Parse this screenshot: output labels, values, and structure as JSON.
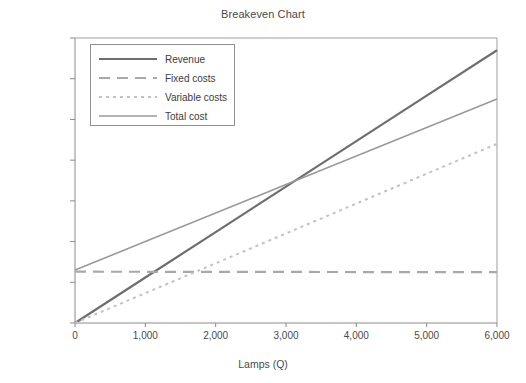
{
  "chart_data": {
    "type": "line",
    "title": "Breakeven Chart",
    "xlabel": "Lamps (Q)",
    "ylabel": "",
    "xlim": [
      0,
      6000
    ],
    "ylim": [
      0,
      700000
    ],
    "grid": false,
    "legend_position": "upper-left",
    "x": [
      0,
      1000,
      2000,
      3000,
      4000,
      5000,
      6000
    ],
    "xticks": [
      "0",
      "1,000",
      "2,000",
      "3,000",
      "4,000",
      "5,000",
      "6,000"
    ],
    "yticks": [
      "$0",
      "$100,000",
      "$200,000",
      "$300,000",
      "$400,000",
      "$500,000",
      "$600,000",
      "$700,000"
    ],
    "ytick_values": [
      0,
      100000,
      200000,
      300000,
      400000,
      500000,
      600000,
      700000
    ],
    "series": [
      {
        "name": "Revenue",
        "style": "solid",
        "color": "#6e6e6e",
        "width": 2.2,
        "values": [
          0,
          111667,
          223333,
          335000,
          446667,
          558333,
          670000
        ]
      },
      {
        "name": "Fixed costs",
        "style": "dashed",
        "color": "#a8a8a8",
        "width": 2.2,
        "values": [
          126000,
          125800,
          125600,
          125400,
          125200,
          125000,
          124800
        ]
      },
      {
        "name": "Variable costs",
        "style": "dotted",
        "color": "#c2c2c2",
        "width": 2.0,
        "values": [
          0,
          73333,
          146667,
          220000,
          293333,
          366667,
          440000
        ]
      },
      {
        "name": "Total cost",
        "style": "solid",
        "color": "#9a9a9a",
        "width": 1.6,
        "values": [
          130000,
          200000,
          270000,
          340000,
          410000,
          480000,
          550000
        ]
      }
    ],
    "annotations": {
      "breakeven_x": 3100,
      "breakeven_y": 345000
    }
  },
  "legend": {
    "items": [
      {
        "label": "Revenue"
      },
      {
        "label": "Fixed costs"
      },
      {
        "label": "Variable costs"
      },
      {
        "label": "Total cost"
      }
    ]
  }
}
